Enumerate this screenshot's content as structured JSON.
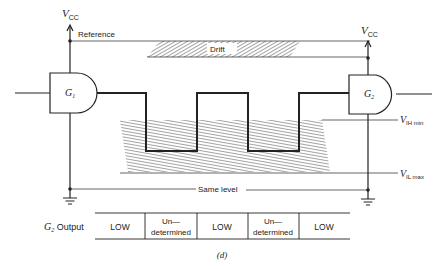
{
  "diagram": {
    "vcc_left": {
      "main": "V",
      "sub": "CC"
    },
    "vcc_right": {
      "main": "V",
      "sub": "CC"
    },
    "reference_label": "Reference",
    "drift_label": "Drift",
    "gate1": {
      "main": "G",
      "sub": "1"
    },
    "gate2": {
      "main": "G",
      "sub": "2"
    },
    "vih_label": {
      "main": "V",
      "sub": "IH min"
    },
    "vil_label": {
      "main": "V",
      "sub": "IL max"
    },
    "same_level_label": "Same level",
    "caption": "(d)"
  },
  "output_table": {
    "row_label": {
      "main": "G",
      "sub": "2",
      "rest": " Output"
    },
    "cells": [
      {
        "line1": "LOW",
        "line2": ""
      },
      {
        "line1": "Un—",
        "line2": "determined"
      },
      {
        "line1": "LOW",
        "line2": ""
      },
      {
        "line1": "Un—",
        "line2": "determined"
      },
      {
        "line1": "LOW",
        "line2": ""
      }
    ]
  },
  "colors": {
    "ink": "#222222",
    "hatch": "#333333",
    "background": "#ffffff"
  }
}
